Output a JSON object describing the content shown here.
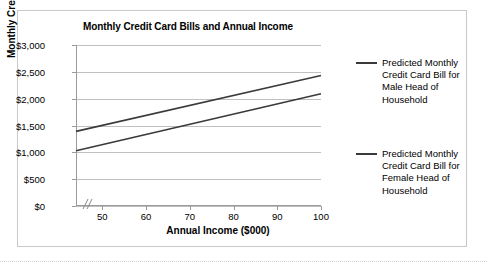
{
  "chart_data": {
    "type": "line",
    "title": "Monthly Credit Card Bills and Annual Income",
    "xlabel": "Annual Income ($000)",
    "ylabel": "Monthly Credit Card Bill",
    "xlim": [
      44,
      100
    ],
    "ylim": [
      0,
      3000
    ],
    "grid": true,
    "axis_break": "//",
    "legend_position": "right",
    "xticks": [
      50,
      60,
      70,
      80,
      90,
      100
    ],
    "xtick_labels": [
      "50",
      "60",
      "70",
      "80",
      "90",
      "100"
    ],
    "yticks": [
      0,
      500,
      1000,
      1500,
      2000,
      2500,
      3000
    ],
    "ytick_labels": [
      "$0",
      "$500",
      "$1,000",
      "$1,500",
      "$2,000",
      "$2,500",
      "$3,000"
    ],
    "series": [
      {
        "name": "Predicted Monthly Credit Card Bill for Male Head of Household",
        "color": "#3a3a3a",
        "x": [
          44,
          100
        ],
        "values": [
          1390,
          2430
        ]
      },
      {
        "name": "Predicted Monthly Credit Card Bill for Female Head of Household",
        "color": "#3a3a3a",
        "x": [
          44,
          100
        ],
        "values": [
          1030,
          2090
        ]
      }
    ]
  },
  "legend": {
    "entries": [
      {
        "label": "Predicted Monthly Credit Card Bill for Male Head of Household"
      },
      {
        "label": "Predicted Monthly Credit Card Bill for Female Head of Household"
      }
    ]
  }
}
